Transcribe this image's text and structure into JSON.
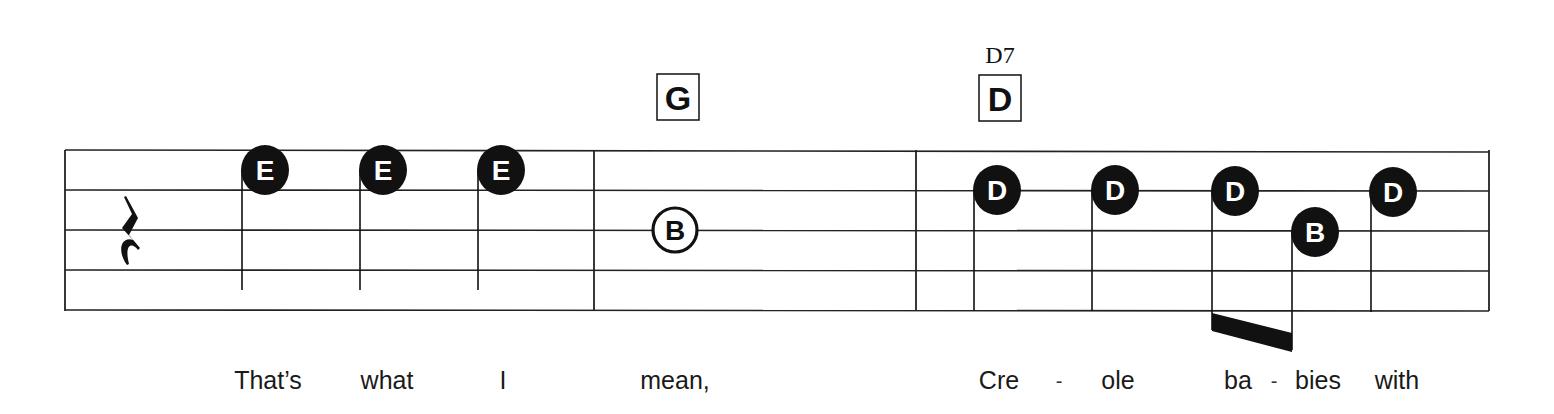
{
  "score": {
    "staff": {
      "line_color": "#222222",
      "line_count": 5,
      "left_x": 65,
      "right_x": 1489,
      "lines_y": [
        150,
        190,
        230,
        270,
        310
      ]
    },
    "barlines_x": [
      65,
      594,
      916,
      1489
    ],
    "rest": {
      "type": "quarter-rest",
      "x": 132,
      "y": 230
    },
    "chords": [
      {
        "label": "G",
        "alt_label": "",
        "x": 678,
        "box_top": 74
      },
      {
        "label": "D",
        "alt_label": "D7",
        "x": 1000,
        "box_top": 75
      }
    ],
    "notes": [
      {
        "letter": "E",
        "cx": 265,
        "cy": 170,
        "filled": true,
        "stem_x": 242,
        "stem_end": 290,
        "measure": 1
      },
      {
        "letter": "E",
        "cx": 383,
        "cy": 170,
        "filled": true,
        "stem_x": 360,
        "stem_end": 290,
        "measure": 1
      },
      {
        "letter": "E",
        "cx": 501,
        "cy": 170,
        "filled": true,
        "stem_x": 478,
        "stem_end": 290,
        "measure": 1
      },
      {
        "letter": "B",
        "cx": 675,
        "cy": 230,
        "filled": false,
        "stem_x": null,
        "stem_end": null,
        "measure": 2
      },
      {
        "letter": "D",
        "cx": 997,
        "cy": 190,
        "filled": true,
        "stem_x": 974,
        "stem_end": 311,
        "measure": 3
      },
      {
        "letter": "D",
        "cx": 1115,
        "cy": 190,
        "filled": true,
        "stem_x": 1092,
        "stem_end": 311,
        "measure": 3
      },
      {
        "letter": "D",
        "cx": 1235,
        "cy": 191,
        "filled": true,
        "stem_x": 1212,
        "stem_end": 330,
        "measure": 3
      },
      {
        "letter": "B",
        "cx": 1315,
        "cy": 232,
        "filled": true,
        "stem_x": 1292,
        "stem_end": 350,
        "measure": 3
      },
      {
        "letter": "D",
        "cx": 1393,
        "cy": 192,
        "filled": true,
        "stem_x": 1371,
        "stem_end": 312,
        "measure": 3
      }
    ],
    "beam": {
      "from_note": 6,
      "to_note": 7,
      "points": "1212,313 1292,333 1292,352 1212,331"
    },
    "lyrics": [
      {
        "text": "That’s",
        "x": 268,
        "type": "word"
      },
      {
        "text": "what",
        "x": 387,
        "type": "word"
      },
      {
        "text": "I",
        "x": 503,
        "type": "word"
      },
      {
        "text": "mean,",
        "x": 675,
        "type": "word"
      },
      {
        "text": "Cre",
        "x": 999,
        "type": "word"
      },
      {
        "text": "-",
        "x": 1059,
        "type": "hyphen"
      },
      {
        "text": "ole",
        "x": 1118,
        "type": "word"
      },
      {
        "text": "ba",
        "x": 1238,
        "type": "word"
      },
      {
        "text": "-",
        "x": 1274,
        "type": "hyphen"
      },
      {
        "text": "bies",
        "x": 1318,
        "type": "word"
      },
      {
        "text": "with",
        "x": 1397,
        "type": "word"
      }
    ]
  }
}
